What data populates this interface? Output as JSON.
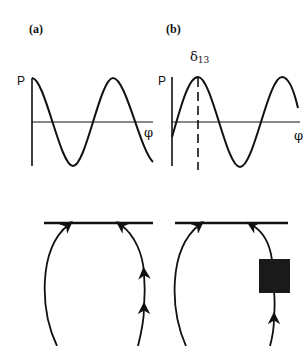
{
  "panels": [
    {
      "label": "(a)",
      "graph": {
        "y_label": "P",
        "x_label": "φ"
      },
      "diagram": {
        "description": "closed loop with arrows pointing up toward a horizontal line"
      }
    },
    {
      "label": "(b)",
      "graph": {
        "y_label": "P",
        "x_label": "φ",
        "marker_label": "δ",
        "marker_subscript": "13"
      },
      "diagram": {
        "description": "closed loop with arrows and a filled black square on the right branch"
      }
    }
  ],
  "colors": {
    "stroke": "#111111",
    "block": "#1a1a1a",
    "background": "#ffffff"
  }
}
